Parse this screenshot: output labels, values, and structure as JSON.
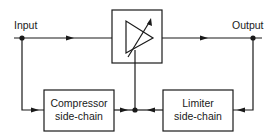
{
  "diagram": {
    "type": "block-diagram",
    "labels": {
      "input": "Input",
      "output": "Output"
    },
    "blocks": [
      {
        "id": "amplifier",
        "kind": "variable-gain-amplifier",
        "label": ""
      },
      {
        "id": "compressor",
        "line1": "Compressor",
        "line2": "side-chain"
      },
      {
        "id": "limiter",
        "line1": "Limiter",
        "line2": "side-chain"
      }
    ],
    "connections": [
      {
        "from": "input",
        "to": "amplifier"
      },
      {
        "from": "amplifier",
        "to": "output"
      },
      {
        "from": "input",
        "to": "compressor"
      },
      {
        "from": "output",
        "to": "limiter"
      },
      {
        "from": "compressor",
        "to": "amplifier-control"
      },
      {
        "from": "limiter",
        "to": "amplifier-control"
      }
    ],
    "line_color": "#1a1a1a"
  }
}
